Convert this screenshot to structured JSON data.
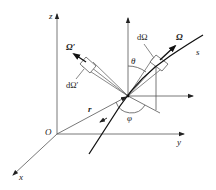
{
  "labels": {
    "z_axis": "z",
    "y_axis": "y",
    "x_axis": "x",
    "origin": "O",
    "position_vector": "r",
    "path": "s",
    "direction": "Ω",
    "direction_prime": "Ω′",
    "solid_angle": "dΩ",
    "solid_angle_prime": "dΩ′",
    "polar_angle": "θ",
    "azimuth_angle": "φ"
  },
  "colors": {
    "line": "#555555",
    "heavy": "#111111",
    "background": "#ffffff"
  }
}
